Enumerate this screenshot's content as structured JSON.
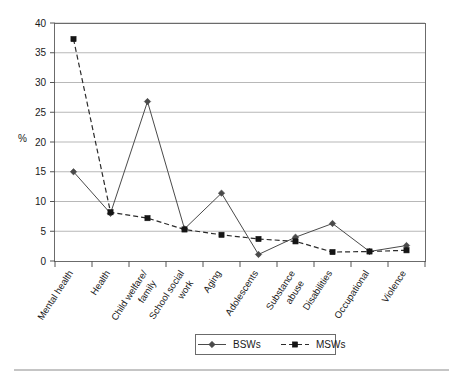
{
  "chart_data": {
    "type": "line",
    "title": "",
    "xlabel": "",
    "ylabel": "%",
    "ylim": [
      0,
      40
    ],
    "yticks": [
      0,
      5,
      10,
      15,
      20,
      25,
      30,
      35,
      40
    ],
    "grid": true,
    "legend_position": "bottom",
    "categories": [
      "Mental health",
      "Health",
      "Child welfare/ family",
      "School social work",
      "Aging",
      "Adolescents",
      "Substance abuse",
      "Disabilities",
      "Occupational",
      "Violence"
    ],
    "series": [
      {
        "name": "BSWs",
        "marker": "diamond",
        "line_style": "solid",
        "color": "#4a4a4a",
        "values": [
          15.0,
          8.0,
          26.8,
          5.4,
          11.4,
          1.1,
          4.0,
          6.3,
          1.6,
          2.6
        ]
      },
      {
        "name": "MSWs",
        "marker": "square",
        "line_style": "dashed",
        "color": "#151515",
        "values": [
          37.3,
          8.2,
          7.2,
          5.3,
          4.4,
          3.7,
          3.3,
          1.5,
          1.6,
          1.8
        ]
      }
    ]
  },
  "axis": {
    "y_title": "%",
    "tick_labels": [
      "0",
      "5",
      "10",
      "15",
      "20",
      "25",
      "30",
      "35",
      "40"
    ]
  },
  "legend": {
    "items": [
      {
        "label": "BSWs"
      },
      {
        "label": "MSWs"
      }
    ]
  }
}
